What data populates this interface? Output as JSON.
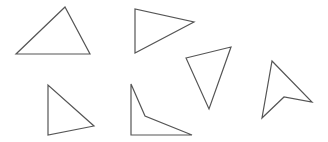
{
  "canvas": {
    "width": 328,
    "height": 142,
    "background": "#ffffff",
    "stroke_color": "#555555"
  },
  "shapes": [
    {
      "id": "shape-1",
      "type": "triangle",
      "points": "65,7 16,54 90,54"
    },
    {
      "id": "shape-2",
      "type": "triangle",
      "points": "135,9 135,53 194,22"
    },
    {
      "id": "shape-3",
      "type": "triangle",
      "points": "186,58 231,47 209,109"
    },
    {
      "id": "shape-4",
      "type": "triangle",
      "points": "48,85 48,135 94,126"
    },
    {
      "id": "shape-5",
      "type": "concave-quadrilateral",
      "points": "131,84 145,116 192,135 131,135"
    },
    {
      "id": "shape-6",
      "type": "arrowhead-quadrilateral",
      "points": "272,61 312,102 284,97 262,118"
    }
  ]
}
